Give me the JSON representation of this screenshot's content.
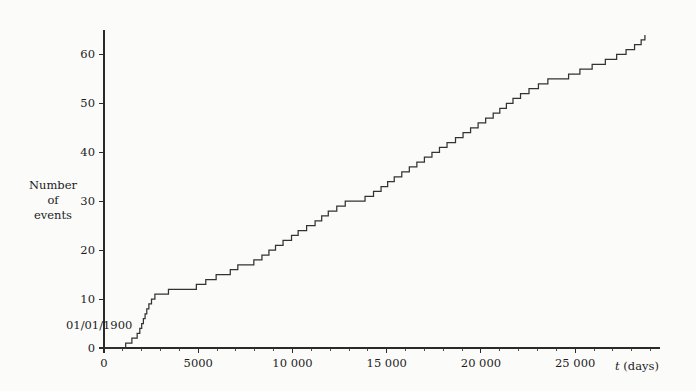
{
  "figure": {
    "background_color": "#fbfbfa",
    "curve_color": "#333333",
    "axis_color": "#2a2a2a",
    "origin_annotation": "01/01/1900",
    "ylabel_line1": "Number",
    "ylabel_line2": "of",
    "ylabel_line3": "events",
    "xlabel_symbol": "t",
    "xlabel_unit": "(days)"
  },
  "chart_data": {
    "type": "line",
    "subtype": "step-post cumulative counting process",
    "title": "",
    "subtitle": "",
    "xlabel": "t (days)",
    "ylabel": "Number of events",
    "grid": false,
    "legend": null,
    "xlim": [
      0,
      29500
    ],
    "ylim": [
      0,
      65
    ],
    "x_major_ticks": [
      0,
      5000,
      10000,
      15000,
      20000,
      25000
    ],
    "x_major_tick_labels": [
      "0",
      "5000",
      "10 000",
      "15 000",
      "20 000",
      "25 000"
    ],
    "x_minor_tick_step": 1000,
    "y_major_ticks": [
      0,
      10,
      20,
      30,
      40,
      50,
      60
    ],
    "y_major_tick_labels": [
      "0",
      "10",
      "20",
      "30",
      "40",
      "50",
      "60"
    ],
    "annotations": [
      {
        "text": "01/01/1900",
        "x": 0,
        "y": 4,
        "placement": "left-of-origin"
      }
    ],
    "series": [
      {
        "name": "Cumulative number of events",
        "step": "post",
        "x": [
          0,
          1150,
          1480,
          1760,
          1900,
          2000,
          2090,
          2180,
          2270,
          2380,
          2520,
          2700,
          3050,
          3420,
          4150,
          4900,
          5400,
          5950,
          6700,
          7100,
          7500,
          7950,
          8380,
          8750,
          9100,
          9500,
          9950,
          10300,
          10750,
          11200,
          11550,
          11900,
          12350,
          12800,
          13350,
          13850,
          14300,
          14700,
          15050,
          15400,
          15800,
          16200,
          16600,
          17000,
          17400,
          17800,
          18200,
          18650,
          19050,
          19450,
          19850,
          20250,
          20650,
          21000,
          21350,
          21700,
          22100,
          22550,
          23050,
          23550,
          24100,
          24650,
          25250,
          25900,
          26600,
          27200,
          27700,
          28150,
          28500,
          28700
        ],
        "y": [
          0,
          1,
          2,
          3,
          4,
          5,
          6,
          7,
          8,
          9,
          10,
          11,
          11,
          12,
          12,
          13,
          14,
          15,
          16,
          17,
          17,
          18,
          19,
          20,
          21,
          22,
          23,
          24,
          25,
          26,
          27,
          28,
          29,
          30,
          30,
          31,
          32,
          33,
          34,
          35,
          36,
          37,
          38,
          39,
          40,
          41,
          42,
          43,
          44,
          45,
          46,
          47,
          48,
          49,
          50,
          51,
          52,
          53,
          54,
          55,
          55,
          56,
          57,
          58,
          59,
          60,
          61,
          62,
          63,
          64
        ]
      }
    ]
  }
}
